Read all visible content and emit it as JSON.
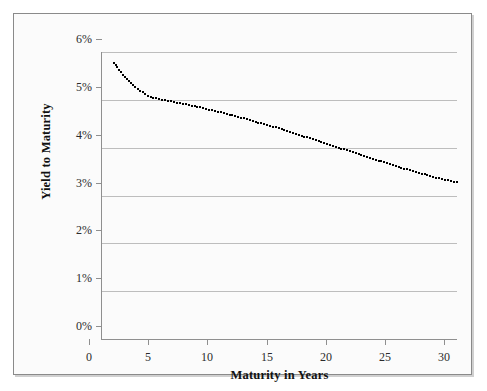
{
  "chart_data": {
    "type": "line",
    "title": "",
    "xlabel": "Maturity in Years",
    "ylabel": "Yield to Maturity",
    "xlim": [
      0,
      30
    ],
    "ylim": [
      0,
      6
    ],
    "xticks": [
      "0",
      "5",
      "10",
      "15",
      "20",
      "25",
      "30"
    ],
    "xtick_values": [
      0,
      5,
      10,
      15,
      20,
      25,
      30
    ],
    "yticks": [
      "0%",
      "1%",
      "2%",
      "3%",
      "4%",
      "5%",
      "6%"
    ],
    "ytick_values": [
      0,
      1,
      2,
      3,
      4,
      5,
      6
    ],
    "grid": "horizontal",
    "legend": "none",
    "series": [
      {
        "name": "Yield curve",
        "style": "dotted",
        "color": "#000000",
        "x": [
          1,
          2,
          3,
          4,
          5,
          6,
          7,
          8,
          9,
          10,
          11,
          12,
          13,
          14,
          15,
          16,
          17,
          18,
          19,
          20,
          21,
          22,
          23,
          24,
          25,
          26,
          27,
          28,
          29,
          30
        ],
        "values": [
          5.78,
          5.45,
          5.22,
          5.07,
          5.0,
          4.96,
          4.91,
          4.86,
          4.8,
          4.74,
          4.68,
          4.61,
          4.54,
          4.47,
          4.4,
          4.32,
          4.24,
          4.16,
          4.08,
          4.0,
          3.92,
          3.84,
          3.76,
          3.68,
          3.6,
          3.53,
          3.46,
          3.39,
          3.33,
          3.27
        ]
      }
    ]
  },
  "figure": {
    "background_color": "#fbfbfb",
    "frame_color": "#8a8a8a",
    "grid_color": "#bdbdbd",
    "axis_color": "#8f8f8f",
    "series_color": "#000000"
  }
}
